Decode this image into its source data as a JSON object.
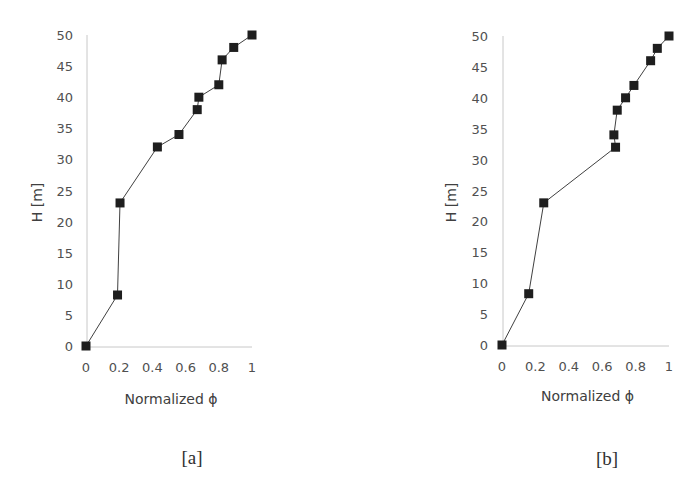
{
  "figure": {
    "panels": [
      {
        "id": "a",
        "label": "[a]"
      },
      {
        "id": "b",
        "label": "[b]"
      }
    ]
  },
  "chart_data": [
    {
      "type": "line",
      "panel_label": "[a]",
      "title": "",
      "xlabel": "Normalized ϕ",
      "ylabel": "H [m]",
      "xlim": [
        0,
        1
      ],
      "ylim": [
        0,
        50
      ],
      "xticks": [
        "0",
        "0.2",
        "0.4",
        "0.6",
        "0.8",
        "1"
      ],
      "yticks": [
        "0",
        "5",
        "10",
        "15",
        "20",
        "25",
        "30",
        "35",
        "40",
        "45",
        "50"
      ],
      "grid": false,
      "marker": "square",
      "series": [
        {
          "name": "profile",
          "x": [
            0,
            0.19,
            0.205,
            0.43,
            0.56,
            0.67,
            0.68,
            0.8,
            0.82,
            0.89,
            1.0
          ],
          "y": [
            0,
            8.2,
            23,
            32,
            34,
            38,
            40,
            42,
            46,
            48,
            50
          ]
        }
      ]
    },
    {
      "type": "line",
      "panel_label": "[b]",
      "title": "",
      "xlabel": "Normalized ϕ",
      "ylabel": "H [m]",
      "xlim": [
        0,
        1
      ],
      "ylim": [
        0,
        50
      ],
      "xticks": [
        "0",
        "0.2",
        "0.4",
        "0.6",
        "0.8",
        "1"
      ],
      "yticks": [
        "0",
        "5",
        "10",
        "15",
        "20",
        "25",
        "30",
        "35",
        "40",
        "45",
        "50"
      ],
      "grid": false,
      "marker": "square",
      "series": [
        {
          "name": "profile",
          "x": [
            0,
            0.16,
            0.25,
            0.68,
            0.67,
            0.69,
            0.74,
            0.79,
            0.89,
            0.93,
            1.0
          ],
          "y": [
            0,
            8.3,
            23,
            32,
            34,
            38,
            40,
            42,
            46,
            48,
            50
          ]
        }
      ]
    }
  ],
  "colors": {
    "marker": "#1e1e1e",
    "line": "#404040",
    "axis": "#c8c8c8",
    "text": "#404040"
  }
}
